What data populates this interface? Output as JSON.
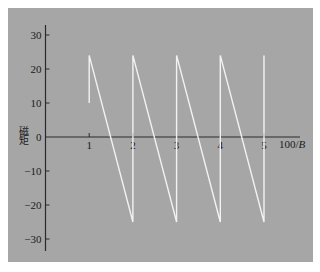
{
  "chart_data": {
    "type": "line",
    "title": "",
    "xlabel": "100/B",
    "ylabel": "磁矩",
    "x_ticks": [
      1,
      2,
      3,
      4,
      5
    ],
    "y_ticks": [
      30,
      20,
      10,
      0,
      -10,
      -20,
      -30
    ],
    "xlim": [
      0,
      6.0
    ],
    "ylim": [
      -34,
      34
    ],
    "grid": false,
    "legend": null,
    "series": [
      {
        "name": "sawtooth",
        "color": "#f2f2f2",
        "points": [
          [
            1,
            10
          ],
          [
            1,
            24
          ],
          [
            2,
            -25
          ],
          [
            2,
            24
          ],
          [
            3,
            -25
          ],
          [
            3,
            24
          ],
          [
            4,
            -25
          ],
          [
            4,
            24
          ],
          [
            5,
            -25
          ],
          [
            5,
            24
          ]
        ]
      }
    ]
  },
  "colors": {
    "panel_background": "#a6a6a6",
    "axis": "#2a2a2a",
    "line": "#f2f2f2"
  },
  "labels": {
    "xlabel_prefix": "100/",
    "xlabel_var": "B",
    "ylabel": "磁矩"
  }
}
